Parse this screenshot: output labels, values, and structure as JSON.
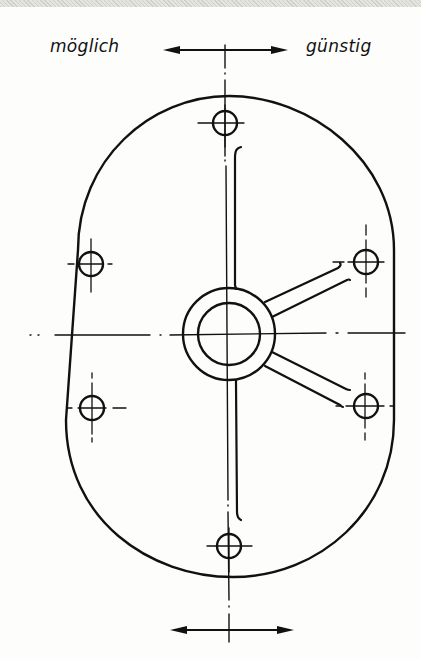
{
  "labels": {
    "left": "möglich",
    "right": "günstig"
  },
  "colors": {
    "ink": "#111111",
    "paper": "#fdfdfb"
  },
  "drawing": {
    "outline": {
      "type": "stadium",
      "left": 58,
      "right": 400,
      "top": 95,
      "bottom": 578,
      "ends": "rounded"
    },
    "center": {
      "x": 229,
      "y": 333
    },
    "hub": {
      "outer_r": 52,
      "inner_r": 32
    },
    "holes": [
      {
        "name": "top",
        "x": 225,
        "y": 123,
        "r": 12
      },
      {
        "name": "upper-left",
        "x": 91,
        "y": 264,
        "r": 12
      },
      {
        "name": "lower-left",
        "x": 91,
        "y": 407,
        "r": 12
      },
      {
        "name": "upper-right",
        "x": 366,
        "y": 262,
        "r": 12
      },
      {
        "name": "lower-right",
        "x": 366,
        "y": 406,
        "r": 12
      },
      {
        "name": "bottom",
        "x": 229,
        "y": 546,
        "r": 12
      }
    ],
    "ribs": [
      "vertical-up",
      "vertical-down",
      "diagonal-upper-right",
      "diagonal-lower-right"
    ],
    "arrows": [
      {
        "name": "top-arrow",
        "x1": 163,
        "x2": 288,
        "y": 50
      },
      {
        "name": "bottom-arrow",
        "x1": 170,
        "x2": 294,
        "y": 630
      }
    ]
  }
}
